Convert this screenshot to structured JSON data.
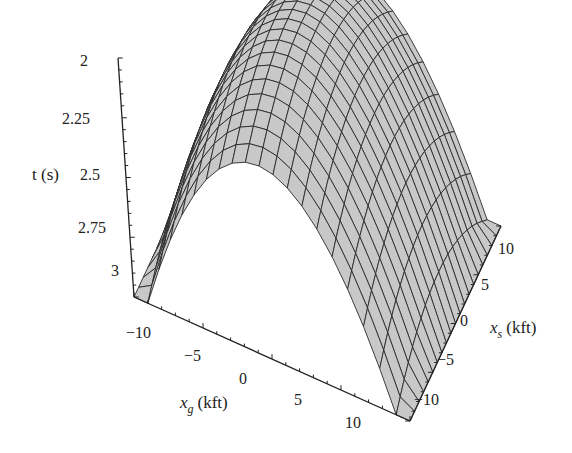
{
  "chart_data": {
    "type": "surface3d",
    "title": "",
    "axes": {
      "t": {
        "label": "t (s)",
        "ticks": [
          "2",
          "2.25",
          "2.5",
          "2.75",
          "3"
        ],
        "range": [
          2,
          3
        ],
        "inverted": true
      },
      "xg": {
        "label": "x_g (kft)",
        "label_main": "x",
        "label_sub": "g",
        "label_unit": "(kft)",
        "ticks": [
          "−10",
          "−5",
          "0",
          "5",
          "10"
        ],
        "range": [
          -10,
          10
        ]
      },
      "xs": {
        "label": "x_s (kft)",
        "label_main": "x",
        "label_sub": "s",
        "label_unit": "(kft)",
        "ticks": [
          "10",
          "5",
          "0",
          "−5",
          "−10"
        ],
        "range": [
          -10,
          10
        ]
      }
    },
    "surface": {
      "grid_lines": 21,
      "peak": {
        "xg": 0,
        "xs": 0,
        "t": 2.0
      },
      "corner_values": {
        "xg=-10": 3.0,
        "xg=10": 3.0
      },
      "shape": "hyperbolic traveltime, minimum t at xg = xs, maximum near corners"
    },
    "colors": {
      "surface_fill": "#c8c8c8",
      "mesh": "#2a2a2a",
      "axis": "#222222"
    }
  }
}
